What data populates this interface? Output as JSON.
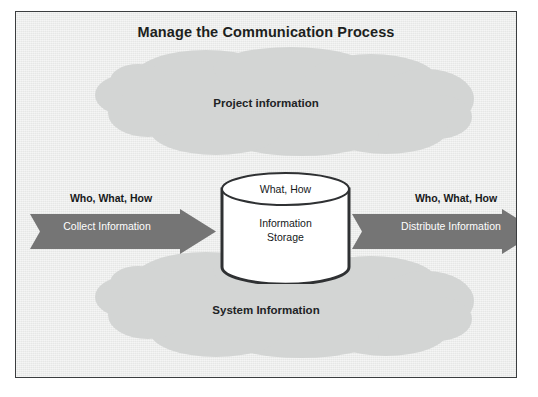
{
  "diagram": {
    "title": "Manage the Communication Process",
    "frame_border_color": "#3b3d3f",
    "background_color": "#ecedec"
  },
  "clouds": [
    {
      "name": "project-information-cloud",
      "label": "Project information",
      "fill": "#d3d5d4",
      "position": "top"
    },
    {
      "name": "system-information-cloud",
      "label": "System Information",
      "fill": "#d3d5d4",
      "position": "bottom"
    }
  ],
  "arrows": [
    {
      "name": "collect-information-arrow",
      "caption": "Who, What, How",
      "label": "Collect Information",
      "direction": "right",
      "fill": "#757575",
      "label_color": "#ffffff"
    },
    {
      "name": "distribute-information-arrow",
      "caption": "Who, What, How",
      "label": "Distribute Information",
      "direction": "right",
      "fill": "#757575",
      "label_color": "#ffffff"
    }
  ],
  "cylinder": {
    "name": "information-storage-cylinder",
    "top_label": "What, How",
    "body_label": "Information\nStorage",
    "fill": "#ffffff",
    "stroke": "#2f3133"
  }
}
